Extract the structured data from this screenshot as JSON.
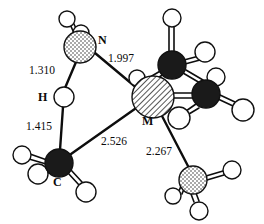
{
  "figure": {
    "type": "molecular-structure-diagram",
    "title": "",
    "background_color": "#ffffff",
    "line_color": "#0d0d0d"
  },
  "atom_labels": {
    "nitrogen": "N",
    "hydrogen": "H",
    "metal": "M",
    "carbon": "C"
  },
  "bond_distances": {
    "n_h_bridge": "1.310",
    "n_m": "1.997",
    "h_c": "1.415",
    "c_m": "2.526",
    "m_n2": "2.267"
  },
  "atoms": [
    {
      "id": "n1",
      "element": "N",
      "style": "stipple",
      "cx": 80,
      "cy": 47,
      "r": 16,
      "label": "N",
      "label_x": 104,
      "label_y": 40
    },
    {
      "id": "h1",
      "element": "H",
      "style": "open",
      "cx": 67,
      "cy": 19,
      "r": 8,
      "label": ""
    },
    {
      "id": "h2",
      "element": "H",
      "style": "open",
      "cx": 80,
      "cy": 33,
      "r": 8,
      "label": ""
    },
    {
      "id": "hb",
      "element": "H",
      "style": "open",
      "cx": 64,
      "cy": 97,
      "r": 10,
      "label": "H",
      "label_x": 44,
      "label_y": 100
    },
    {
      "id": "c1",
      "element": "C",
      "style": "dark",
      "cx": 59,
      "cy": 163,
      "r": 14,
      "label": "C",
      "label_x": 58,
      "label_y": 185
    },
    {
      "id": "h3",
      "element": "H",
      "style": "open",
      "cx": 22,
      "cy": 155,
      "r": 9,
      "label": ""
    },
    {
      "id": "h4",
      "element": "H",
      "style": "open",
      "cx": 37,
      "cy": 172,
      "r": 10,
      "label": ""
    },
    {
      "id": "h5",
      "element": "H",
      "style": "open",
      "cx": 85,
      "cy": 192,
      "r": 10,
      "label": ""
    },
    {
      "id": "m",
      "element": "M",
      "style": "hatch",
      "cx": 153,
      "cy": 97,
      "r": 21,
      "label": "M",
      "label_x": 146,
      "label_y": 123
    },
    {
      "id": "c2",
      "element": "C",
      "style": "dark",
      "cx": 172,
      "cy": 65,
      "r": 14,
      "label": ""
    },
    {
      "id": "h6",
      "element": "H",
      "style": "open",
      "cx": 172,
      "cy": 18,
      "r": 9,
      "label": ""
    },
    {
      "id": "h7",
      "element": "H",
      "style": "open",
      "cx": 204,
      "cy": 52,
      "r": 9,
      "label": ""
    },
    {
      "id": "h8",
      "element": "H",
      "style": "open",
      "cx": 136,
      "cy": 76,
      "r": 8,
      "label": ""
    },
    {
      "id": "c3",
      "element": "C",
      "style": "dark",
      "cx": 206,
      "cy": 94,
      "r": 14,
      "label": ""
    },
    {
      "id": "h9",
      "element": "H",
      "style": "open",
      "cx": 213,
      "cy": 73,
      "r": 9,
      "label": ""
    },
    {
      "id": "h10",
      "element": "H",
      "style": "open",
      "cx": 243,
      "cy": 110,
      "r": 10,
      "label": ""
    },
    {
      "id": "h11",
      "element": "H",
      "style": "open",
      "cx": 178,
      "cy": 117,
      "r": 10,
      "label": ""
    },
    {
      "id": "n2",
      "element": "N",
      "style": "stipple",
      "cx": 193,
      "cy": 180,
      "r": 14,
      "label": ""
    },
    {
      "id": "h12",
      "element": "H",
      "style": "open",
      "cx": 232,
      "cy": 170,
      "r": 9,
      "label": ""
    },
    {
      "id": "h13",
      "element": "H",
      "style": "open",
      "cx": 172,
      "cy": 196,
      "r": 8,
      "label": ""
    },
    {
      "id": "h14",
      "element": "H",
      "style": "open",
      "cx": 198,
      "cy": 211,
      "r": 9,
      "label": ""
    }
  ],
  "distance_annotations": [
    {
      "id": "d-n-h",
      "text": "1.310",
      "x": 45,
      "y": 71,
      "for": "N-H"
    },
    {
      "id": "d-n-m",
      "text": "1.997",
      "x": 127,
      "y": 58,
      "for": "N-M"
    },
    {
      "id": "d-h-c",
      "text": "1.415",
      "x": 42,
      "y": 127,
      "for": "H-C"
    },
    {
      "id": "d-c-m",
      "text": "2.526",
      "x": 119,
      "y": 142,
      "for": "C-M"
    },
    {
      "id": "d-m-n2",
      "text": "2.267",
      "x": 166,
      "y": 152,
      "for": "M-N"
    }
  ]
}
